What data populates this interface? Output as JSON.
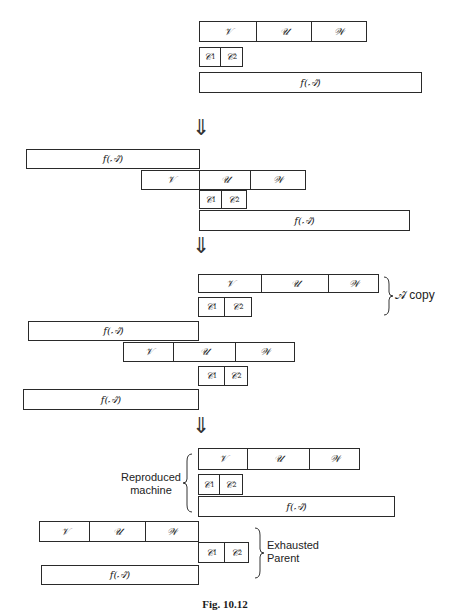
{
  "symbols": {
    "V": "𝒱",
    "U": "𝒰",
    "W": "𝒲",
    "C": "𝒞",
    "f_label": "f(𝒜̂)",
    "c1_sub": "1",
    "c2_sub": "2"
  },
  "arrows": [
    "⇓",
    "⇓",
    "⇓"
  ],
  "annotations": {
    "copy": "𝒜̂ copy",
    "reproduced_line1": "Reproduced",
    "reproduced_line2": "machine",
    "exhausted_line1": "Exhausted",
    "exhausted_line2": "Parent"
  },
  "caption": "Fig. 10.12",
  "colors": {
    "line": "#2a2a2a",
    "background": "#ffffff"
  }
}
